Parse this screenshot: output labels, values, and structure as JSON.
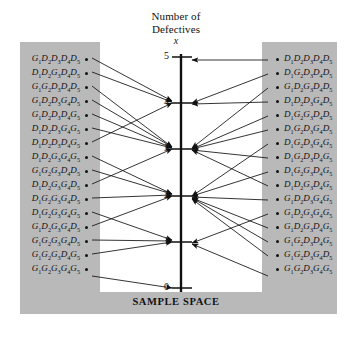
{
  "figure": {
    "title_line1": "Number of",
    "title_line2": "Defectives",
    "axis_variable": "x",
    "footer": "SAMPLE SPACE",
    "axis_ticks": [
      "5",
      "4",
      "3",
      "2",
      "1",
      "0"
    ],
    "colors": {
      "panel_gray": "#b9b9b9",
      "panel_white": "#ffffff",
      "ink": "#111111"
    }
  },
  "left_column": {
    "outcomes": [
      {
        "text": "G1D2D3D4D5",
        "parts": [
          "G",
          "1",
          "D",
          "2",
          "D",
          "3",
          "D",
          "4",
          "D",
          "5"
        ],
        "maps_to": 4
      },
      {
        "text": "D1D2G3D4D5",
        "parts": [
          "D",
          "1",
          "D",
          "2",
          "G",
          "3",
          "D",
          "4",
          "D",
          "5"
        ],
        "maps_to": 4
      },
      {
        "text": "G1G2D3D4D5",
        "parts": [
          "G",
          "1",
          "G",
          "2",
          "D",
          "3",
          "D",
          "4",
          "D",
          "5"
        ],
        "maps_to": 3
      },
      {
        "text": "G1D2D3G4D5",
        "parts": [
          "G",
          "1",
          "D",
          "2",
          "D",
          "3",
          "G",
          "4",
          "D",
          "5"
        ],
        "maps_to": 3
      },
      {
        "text": "G1D2D3D4G5",
        "parts": [
          "G",
          "1",
          "D",
          "2",
          "D",
          "3",
          "D",
          "4",
          "G",
          "5"
        ],
        "maps_to": 3
      },
      {
        "text": "D1D2D3G4G5",
        "parts": [
          "D",
          "1",
          "D",
          "2",
          "D",
          "3",
          "G",
          "4",
          "G",
          "5"
        ],
        "maps_to": 3
      },
      {
        "text": "D1D2D3D4G5",
        "parts": [
          "D",
          "1",
          "D",
          "2",
          "D",
          "3",
          "D",
          "4",
          "G",
          "5"
        ],
        "maps_to": 4
      },
      {
        "text": "D1D2G3G4G5",
        "parts": [
          "D",
          "1",
          "D",
          "2",
          "G",
          "3",
          "G",
          "4",
          "G",
          "5"
        ],
        "maps_to": 2
      },
      {
        "text": "G1G2G3D4D5",
        "parts": [
          "G",
          "1",
          "G",
          "2",
          "G",
          "3",
          "D",
          "4",
          "D",
          "5"
        ],
        "maps_to": 2
      },
      {
        "text": "D1D2G3G4D5",
        "parts": [
          "D",
          "1",
          "D",
          "2",
          "G",
          "3",
          "G",
          "4",
          "D",
          "5"
        ],
        "maps_to": 3
      },
      {
        "text": "D1G2G3G4D5",
        "parts": [
          "D",
          "1",
          "G",
          "2",
          "G",
          "3",
          "G",
          "4",
          "D",
          "5"
        ],
        "maps_to": 2
      },
      {
        "text": "D1G2G3G4G5",
        "parts": [
          "D",
          "1",
          "G",
          "2",
          "G",
          "3",
          "G",
          "4",
          "G",
          "5"
        ],
        "maps_to": 1
      },
      {
        "text": "G1D2G3G4D5",
        "parts": [
          "G",
          "1",
          "D",
          "2",
          "G",
          "3",
          "G",
          "4",
          "D",
          "5"
        ],
        "maps_to": 2
      },
      {
        "text": "G1G2G3G4D5",
        "parts": [
          "G",
          "1",
          "G",
          "2",
          "G",
          "3",
          "G",
          "4",
          "D",
          "5"
        ],
        "maps_to": 1
      },
      {
        "text": "G1G2G3D4G5",
        "parts": [
          "G",
          "1",
          "G",
          "2",
          "G",
          "3",
          "D",
          "4",
          "G",
          "5"
        ],
        "maps_to": 1
      },
      {
        "text": "G1G2G3G4G5",
        "parts": [
          "G",
          "1",
          "G",
          "2",
          "G",
          "3",
          "G",
          "4",
          "G",
          "5"
        ],
        "maps_to": 0
      }
    ]
  },
  "right_column": {
    "outcomes": [
      {
        "text": "D1D2D3D4D5",
        "parts": [
          "D",
          "1",
          "D",
          "2",
          "D",
          "3",
          "D",
          "4",
          "D",
          "5"
        ],
        "maps_to": 5
      },
      {
        "text": "D1G2D3D4D5",
        "parts": [
          "D",
          "1",
          "G",
          "2",
          "D",
          "3",
          "D",
          "4",
          "D",
          "5"
        ],
        "maps_to": 4
      },
      {
        "text": "G1D2G3D4D5",
        "parts": [
          "G",
          "1",
          "D",
          "2",
          "G",
          "3",
          "D",
          "4",
          "D",
          "5"
        ],
        "maps_to": 3
      },
      {
        "text": "D1D2D3G4D5",
        "parts": [
          "D",
          "1",
          "D",
          "2",
          "D",
          "3",
          "G",
          "4",
          "D",
          "5"
        ],
        "maps_to": 4
      },
      {
        "text": "D1G2G3D4D5",
        "parts": [
          "D",
          "1",
          "G",
          "2",
          "G",
          "3",
          "D",
          "4",
          "D",
          "5"
        ],
        "maps_to": 3
      },
      {
        "text": "D1G2D3G4D5",
        "parts": [
          "D",
          "1",
          "G",
          "2",
          "D",
          "3",
          "G",
          "4",
          "D",
          "5"
        ],
        "maps_to": 3
      },
      {
        "text": "D1G2D3G4G5",
        "parts": [
          "D",
          "1",
          "G",
          "2",
          "D",
          "3",
          "G",
          "4",
          "G",
          "5"
        ],
        "maps_to": 2
      },
      {
        "text": "D1G2D3D4G5",
        "parts": [
          "D",
          "1",
          "G",
          "2",
          "D",
          "3",
          "D",
          "4",
          "G",
          "5"
        ],
        "maps_to": 3
      },
      {
        "text": "D1G2G3D4G5",
        "parts": [
          "D",
          "1",
          "G",
          "2",
          "G",
          "3",
          "D",
          "4",
          "G",
          "5"
        ],
        "maps_to": 2
      },
      {
        "text": "D1D2G3D4G5",
        "parts": [
          "D",
          "1",
          "D",
          "2",
          "G",
          "3",
          "D",
          "4",
          "G",
          "5"
        ],
        "maps_to": 3
      },
      {
        "text": "G1D2D3G4G5",
        "parts": [
          "G",
          "1",
          "D",
          "2",
          "D",
          "3",
          "G",
          "4",
          "G",
          "5"
        ],
        "maps_to": 2
      },
      {
        "text": "G1D2G3G4G5",
        "parts": [
          "G",
          "1",
          "D",
          "2",
          "G",
          "3",
          "G",
          "4",
          "G",
          "5"
        ],
        "maps_to": 1
      },
      {
        "text": "G1D2G3D4G5",
        "parts": [
          "G",
          "1",
          "D",
          "2",
          "G",
          "3",
          "D",
          "4",
          "G",
          "5"
        ],
        "maps_to": 2
      },
      {
        "text": "G1G2D3D4G5",
        "parts": [
          "G",
          "1",
          "G",
          "2",
          "D",
          "3",
          "D",
          "4",
          "G",
          "5"
        ],
        "maps_to": 2
      },
      {
        "text": "G1G2D3G4D5",
        "parts": [
          "G",
          "1",
          "G",
          "2",
          "D",
          "3",
          "G",
          "4",
          "D",
          "5"
        ],
        "maps_to": 2
      },
      {
        "text": "G1G2D3G4G5",
        "parts": [
          "G",
          "1",
          "G",
          "2",
          "D",
          "3",
          "G",
          "4",
          "G",
          "5"
        ],
        "maps_to": 1
      }
    ]
  }
}
